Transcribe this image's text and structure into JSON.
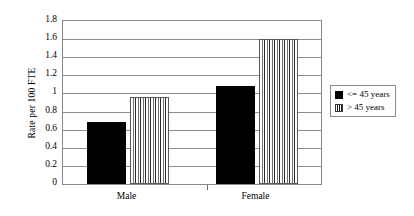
{
  "chart_data": {
    "type": "bar",
    "title": "",
    "xlabel": "",
    "ylabel": "Rate per 100 FTE",
    "categories": [
      "Male",
      "Female"
    ],
    "series": [
      {
        "name": "<= 45 years",
        "values": [
          0.68,
          1.08
        ],
        "fill": "solid",
        "color": "#000000"
      },
      {
        "name": "> 45 years",
        "values": [
          0.96,
          1.6
        ],
        "fill": "striped",
        "color": "#ffffff"
      }
    ],
    "ylim": [
      0,
      1.8
    ],
    "ytick_step": 0.2,
    "yticks": [
      "1.8",
      "1.6",
      "1.4",
      "1.2",
      "1",
      "0.8",
      "0.6",
      "0.4",
      "0.2",
      "0"
    ],
    "ytick_values": [
      1.8,
      1.6,
      1.4,
      1.2,
      1.0,
      0.8,
      0.6,
      0.4,
      0.2,
      0
    ],
    "grid": true,
    "grid_axis": "y",
    "legend_position": "right"
  },
  "legend": {
    "entries": [
      {
        "label": "<= 45 years",
        "fill": "solid"
      },
      {
        "label": "> 45 years",
        "fill": "striped"
      }
    ]
  }
}
